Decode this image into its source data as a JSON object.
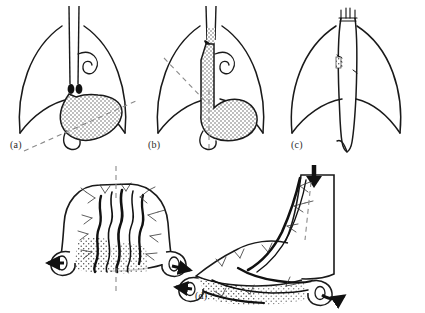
{
  "figure": {
    "width": 425,
    "height": 313,
    "background_color": "#ffffff",
    "ink_color": "#1a1a1a",
    "stipple_color": "#6e6e6e",
    "dash_color": "#8a8a8a"
  },
  "panels": [
    {
      "id": "a",
      "label": "(a)",
      "caption": "Stomach in situ beneath the diaphragm with oblique resection line",
      "structures": [
        "diaphragm",
        "esophagus",
        "vagus-nerve-curl",
        "gastroesophageal-junction-marker",
        "stomach-body",
        "duodenum"
      ],
      "annotation": "oblique dashed transection line running from lower-left to mid-right across the stomach"
    },
    {
      "id": "b",
      "label": "(b)",
      "caption": "Greater-curvature tube outlined by a vertical dashed line",
      "structures": [
        "diaphragm",
        "esophagus",
        "vagus-nerve-curl",
        "gastroesophageal-junction-marker",
        "stomach-body",
        "duodenum"
      ],
      "annotation": "vertical dashed line through the stomach marking the tube, plus an oblique dashed line to the upper-left diaphragm"
    },
    {
      "id": "c",
      "label": "(c)",
      "caption": "Completed narrow gastric tube drawn up through the chest",
      "structures": [
        "diaphragm",
        "gastric-tube",
        "staple-line-marks",
        "anastomosis-sutures"
      ],
      "annotation": "slender tubular conduit spanning the full height of the thorax"
    },
    {
      "id": "d",
      "label": "(d)",
      "caption": "Opened specimen showing mucosal rugae before and after tubularization",
      "structures": [
        "fundus-dome",
        "mucosal-rugae",
        "vascular-arcade",
        "stippled-submucosa",
        "rolled-cut-edges",
        "direction-arrows"
      ],
      "annotation": "left drawing bisected by a vertical dashed line; right drawing shows the rolled tube with a bold arrow at its apex"
    }
  ],
  "markers": {
    "arrow_left_label": "left-directed arrow at cut edge",
    "arrow_right_label": "right-directed arrow at rolled edge",
    "arrow_down_label": "downward arrow at tube apex"
  }
}
